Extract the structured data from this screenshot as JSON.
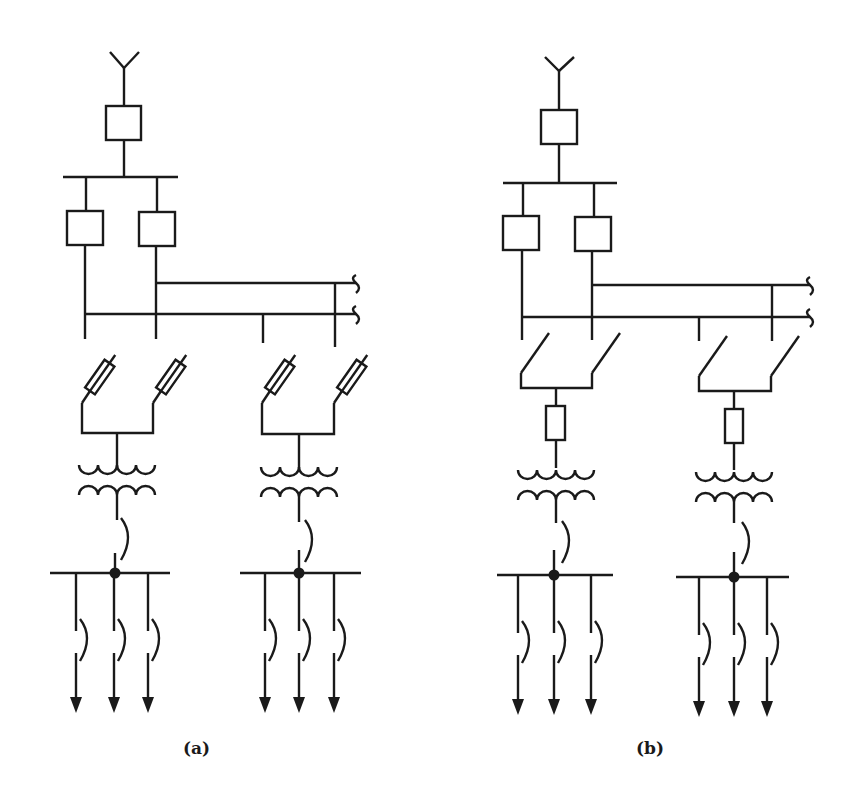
{
  "figure": {
    "panels": [
      {
        "id": "a",
        "caption": "(a)",
        "description": "Antenna feeding circuit breaker to busbar; two breakers feed two bus sections; two transformer groups each fed via two fuse-switches; each LV bus has three outgoing feeders with switches and arrows",
        "feeder_device": "fuse-switch"
      },
      {
        "id": "b",
        "caption": "(b)",
        "description": "Same topology as (a) but each transformer group is fed via two load-break switches and a single fuse in series",
        "feeder_device": "switch-plus-fuse"
      }
    ],
    "colors": {
      "line": "#1a1a1a",
      "background": "#ffffff"
    }
  }
}
